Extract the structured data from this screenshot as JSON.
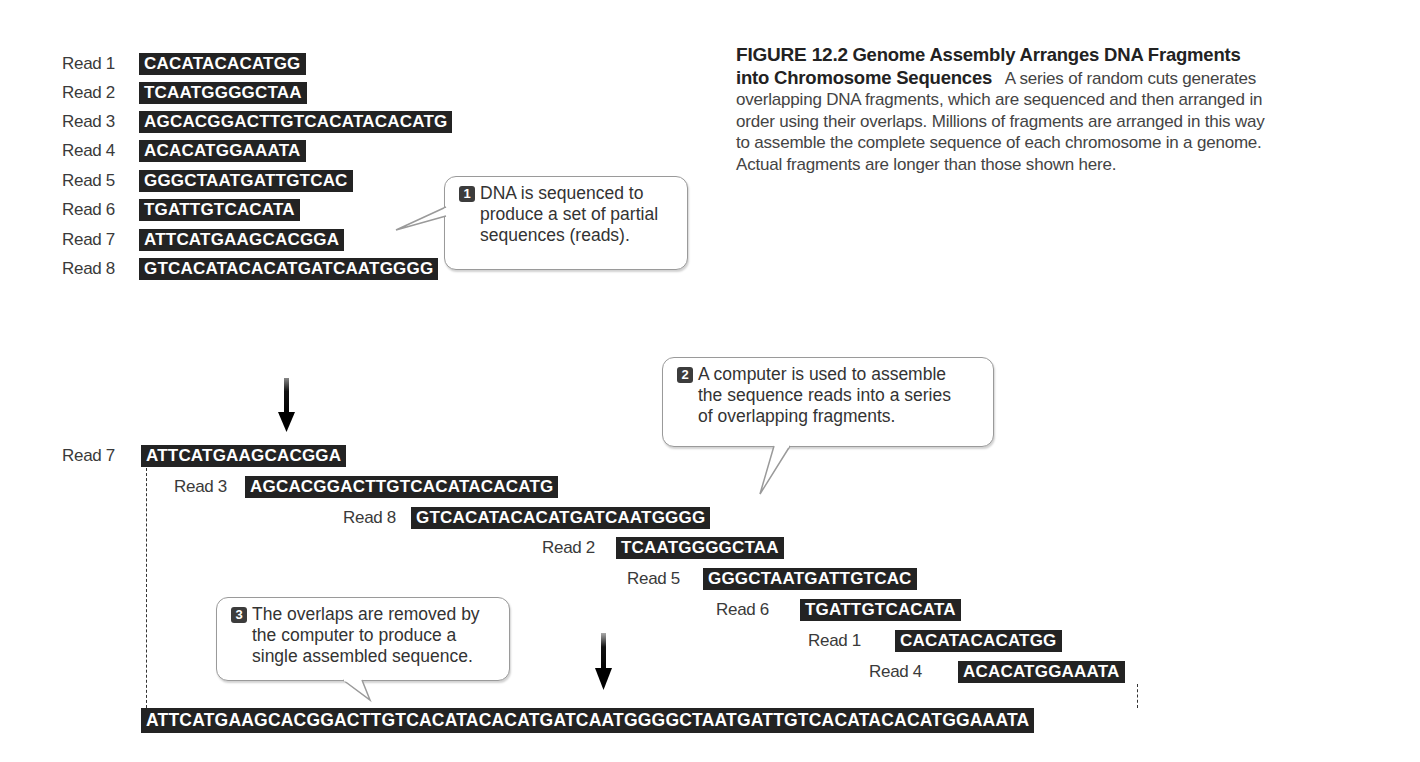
{
  "figure": {
    "number": "FIGURE 12.2",
    "title": "Genome Assembly Arranges DNA Fragments into Chromosome Sequences",
    "title_line1": "Genome Assembly Arranges DNA Fragments",
    "title_line2": "into Chromosome Sequences",
    "caption_line2_rest": "A series of random cuts generates",
    "caption_line3": "overlapping DNA fragments, which are sequenced and then arranged in",
    "caption_line4": "order using their overlaps. Millions of fragments are arranged in this way",
    "caption_line5": "to assemble the complete sequence of each chromosome in a genome.",
    "caption_line6": "Actual fragments are longer than those shown here."
  },
  "reads": [
    {
      "label": "Read 1",
      "sequence": "CACATACACATGG"
    },
    {
      "label": "Read 2",
      "sequence": "TCAATGGGGCTAA"
    },
    {
      "label": "Read 3",
      "sequence": "AGCACGGACTTGTCACATACACATG"
    },
    {
      "label": "Read 4",
      "sequence": "ACACATGGAAATA"
    },
    {
      "label": "Read 5",
      "sequence": "GGGCTAATGATTGTCAC"
    },
    {
      "label": "Read 6",
      "sequence": "TGATTGTCACATA"
    },
    {
      "label": "Read 7",
      "sequence": "ATTCATGAAGCACGGA"
    },
    {
      "label": "Read 8",
      "sequence": "GTCACATACACATGATCAATGGGG"
    }
  ],
  "assembly": [
    {
      "label": "Read 7",
      "sequence": "ATTCATGAAGCACGGA"
    },
    {
      "label": "Read 3",
      "sequence": "AGCACGGACTTGTCACATACACATG"
    },
    {
      "label": "Read 8",
      "sequence": "GTCACATACACATGATCAATGGGG"
    },
    {
      "label": "Read 2",
      "sequence": "TCAATGGGGCTAA"
    },
    {
      "label": "Read 5",
      "sequence": "GGGCTAATGATTGTCAC"
    },
    {
      "label": "Read 6",
      "sequence": "TGATTGTCACATA"
    },
    {
      "label": "Read 1",
      "sequence": "CACATACACATGG"
    },
    {
      "label": "Read 4",
      "sequence": "ACACATGGAAATA"
    }
  ],
  "assembled_sequence": "ATTCATGAAGCACGGACTTGTCACATACACATGATCAATGGGGCTAATGATTGTCACATACACATGGAAATA",
  "callouts": [
    {
      "step": "1",
      "line1": "DNA is sequenced to",
      "line2": "produce a set of partial",
      "line3": "sequences (reads)."
    },
    {
      "step": "2",
      "line1": "A computer is used to assemble",
      "line2": "the sequence reads into a series",
      "line3": "of overlapping fragments."
    },
    {
      "step": "3",
      "line1": "The overlaps are removed by",
      "line2": "the computer to produce a",
      "line3": "single assembled sequence."
    }
  ],
  "colors": {
    "sequence_box": "#232323",
    "sequence_text": "#ffffff",
    "callout_border": "#9a9a9a",
    "step_badge": "#3c3c3c"
  }
}
